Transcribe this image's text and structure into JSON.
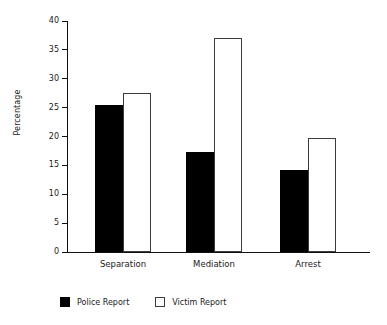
{
  "chart_data": {
    "type": "bar",
    "title": "",
    "xlabel": "",
    "ylabel": "Percentage",
    "categories": [
      "Separation",
      "Mediation",
      "Arrest"
    ],
    "series": [
      {
        "name": "Police Report",
        "color": "#000000",
        "values": [
          25.5,
          17.3,
          14.2
        ]
      },
      {
        "name": "Victim Report",
        "color": "#ffffff",
        "values": [
          27.5,
          37.0,
          19.7
        ]
      }
    ],
    "ylim": [
      0,
      40
    ],
    "yticks": [
      0,
      5,
      10,
      15,
      20,
      25,
      30,
      35,
      40
    ],
    "ytick_labels": [
      "0",
      "5",
      "10",
      "15",
      "20",
      "25",
      "30",
      "35",
      "40"
    ],
    "grid": false,
    "legend_position": "bottom-left",
    "axis_color": "#111111",
    "bar_edge_color": "#3c3c3c"
  },
  "legend": {
    "items": [
      {
        "label": "Police Report",
        "swatch": "police"
      },
      {
        "label": "Victim Report",
        "swatch": "victim"
      }
    ]
  }
}
